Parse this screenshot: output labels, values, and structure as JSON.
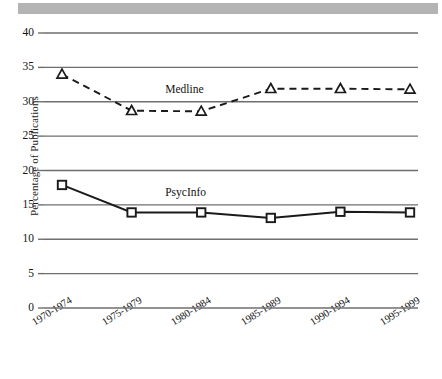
{
  "chart_data": {
    "type": "line",
    "title": "",
    "xlabel": "",
    "ylabel": "Percentage of Publications",
    "categories": [
      "1970-1974",
      "1975-1979",
      "1980-1984",
      "1985-1989",
      "1990-1994",
      "1995-1999"
    ],
    "ylim": [
      0,
      40
    ],
    "ytick_step": 5,
    "yticks": [
      "0",
      "5",
      "10",
      "15",
      "20",
      "25",
      "30",
      "35",
      "40"
    ],
    "grid": "horizontal",
    "legend_position": "inline-annotation",
    "series": [
      {
        "name": "Medline",
        "values": [
          34,
          28.7,
          28.6,
          31.9,
          31.9,
          31.8
        ],
        "line_style": "dashed",
        "marker": "open-triangle",
        "color": "#1a1a1a",
        "label_x_category_index": 2,
        "label_value": 31.5
      },
      {
        "name": "PsycInfo",
        "values": [
          17.9,
          13.9,
          13.9,
          13.1,
          14.0,
          13.9
        ],
        "line_style": "solid",
        "marker": "open-square",
        "color": "#1a1a1a",
        "label_x_category_index": 2,
        "label_value": 16.6
      }
    ]
  },
  "annotations": {
    "medline_label": "Medline",
    "psycinfo_label": "PsycInfo"
  },
  "axis": {
    "y_title": "Percentage of Publications"
  },
  "colors": {
    "ink": "#1a1a1a",
    "grid": "#6e6e6e",
    "scan_band": "#b4b4b4",
    "background": "#ffffff"
  }
}
